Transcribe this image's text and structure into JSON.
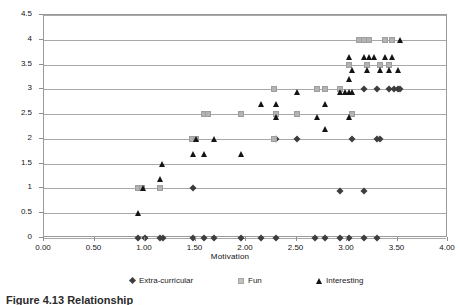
{
  "caption": "Figure 4.13  Relationship",
  "axes": {
    "x_title": "Motivation",
    "y_title": "",
    "x_ticks": [
      "0.00",
      "0.50",
      "1.00",
      "1.50",
      "2.00",
      "2.50",
      "3.00",
      "3.50",
      "4.00"
    ],
    "y_ticks": [
      "0",
      "0.5",
      "1",
      "1.5",
      "2",
      "2.5",
      "3",
      "3.5",
      "4",
      "4.5"
    ]
  },
  "legend": {
    "items": [
      {
        "label": "Extra-curricular",
        "marker": "diamond-marker",
        "color": "#3d3d3d"
      },
      {
        "label": "Fun",
        "marker": "square-marker",
        "color": "#b3b3b3"
      },
      {
        "label": "Interesting",
        "marker": "triangle-marker",
        "color": "#141414"
      }
    ]
  },
  "chart_data": {
    "type": "scatter",
    "title": "",
    "xlabel": "Motivation",
    "ylabel": "",
    "xlim": [
      0.0,
      4.0
    ],
    "ylim": [
      0.0,
      4.5
    ],
    "x_tick_step": 0.5,
    "y_tick_step": 0.5,
    "grid": "horizontal",
    "legend_position": "bottom",
    "series": [
      {
        "name": "Extra-curricular",
        "marker": "diamond",
        "color": "#3d3d3d",
        "points": [
          [
            0.93,
            0.0
          ],
          [
            1.0,
            0.0
          ],
          [
            1.15,
            0.0
          ],
          [
            1.18,
            0.0
          ],
          [
            1.48,
            0.0
          ],
          [
            1.58,
            0.0
          ],
          [
            1.68,
            0.0
          ],
          [
            1.95,
            0.0
          ],
          [
            2.15,
            0.0
          ],
          [
            2.3,
            0.0
          ],
          [
            2.68,
            0.0
          ],
          [
            2.78,
            0.0
          ],
          [
            2.93,
            0.0
          ],
          [
            3.02,
            0.0
          ],
          [
            3.17,
            0.0
          ],
          [
            3.3,
            0.0
          ],
          [
            1.48,
            1.0
          ],
          [
            2.93,
            0.95
          ],
          [
            3.17,
            0.95
          ],
          [
            2.3,
            2.0
          ],
          [
            2.5,
            2.0
          ],
          [
            3.05,
            2.0
          ],
          [
            3.3,
            2.0
          ],
          [
            3.33,
            2.0
          ],
          [
            3.17,
            3.0
          ],
          [
            3.3,
            3.0
          ],
          [
            3.42,
            3.0
          ],
          [
            3.47,
            3.0
          ],
          [
            3.5,
            3.0
          ],
          [
            3.52,
            3.0
          ]
        ]
      },
      {
        "name": "Fun",
        "marker": "square",
        "color": "#b3b3b3",
        "points": [
          [
            0.93,
            1.0
          ],
          [
            0.97,
            1.0
          ],
          [
            1.15,
            1.0
          ],
          [
            1.47,
            2.0
          ],
          [
            1.5,
            2.0
          ],
          [
            2.28,
            2.0
          ],
          [
            1.58,
            2.5
          ],
          [
            1.62,
            2.5
          ],
          [
            1.95,
            2.5
          ],
          [
            2.3,
            2.5
          ],
          [
            2.5,
            2.5
          ],
          [
            3.05,
            2.5
          ],
          [
            2.28,
            3.0
          ],
          [
            2.7,
            3.0
          ],
          [
            2.78,
            3.0
          ],
          [
            2.93,
            3.0
          ],
          [
            3.02,
            3.5
          ],
          [
            3.2,
            3.5
          ],
          [
            3.33,
            3.5
          ],
          [
            3.42,
            3.5
          ],
          [
            3.12,
            4.0
          ],
          [
            3.17,
            4.0
          ],
          [
            3.22,
            4.0
          ],
          [
            3.38,
            4.0
          ],
          [
            3.45,
            4.0
          ]
        ]
      },
      {
        "name": "Interesting",
        "marker": "triangle",
        "color": "#141414",
        "points": [
          [
            0.93,
            0.5
          ],
          [
            0.98,
            1.0
          ],
          [
            1.15,
            1.2
          ],
          [
            1.17,
            1.5
          ],
          [
            1.48,
            1.7
          ],
          [
            1.58,
            1.7
          ],
          [
            1.95,
            1.7
          ],
          [
            1.5,
            2.0
          ],
          [
            1.68,
            2.0
          ],
          [
            2.78,
            2.2
          ],
          [
            2.7,
            2.45
          ],
          [
            2.3,
            2.45
          ],
          [
            3.02,
            2.45
          ],
          [
            2.15,
            2.7
          ],
          [
            2.3,
            2.7
          ],
          [
            2.78,
            2.7
          ],
          [
            2.5,
            2.95
          ],
          [
            2.93,
            2.95
          ],
          [
            2.98,
            2.95
          ],
          [
            3.02,
            2.95
          ],
          [
            3.05,
            2.95
          ],
          [
            3.02,
            3.2
          ],
          [
            3.05,
            3.4
          ],
          [
            3.2,
            3.4
          ],
          [
            3.33,
            3.4
          ],
          [
            3.42,
            3.4
          ],
          [
            3.5,
            3.4
          ],
          [
            3.02,
            3.65
          ],
          [
            3.17,
            3.65
          ],
          [
            3.22,
            3.65
          ],
          [
            3.27,
            3.65
          ],
          [
            3.38,
            3.65
          ],
          [
            3.45,
            3.65
          ],
          [
            3.52,
            4.0
          ]
        ]
      }
    ]
  }
}
